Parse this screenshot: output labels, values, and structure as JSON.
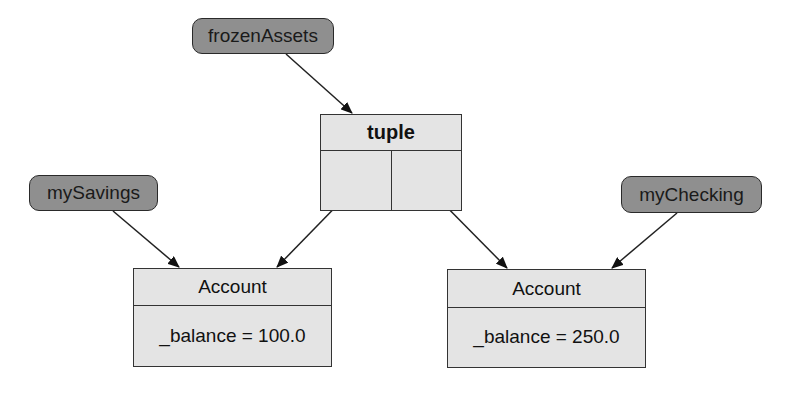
{
  "diagram": {
    "references": [
      {
        "id": "frozenAssets",
        "label": "frozenAssets"
      },
      {
        "id": "mySavings",
        "label": "mySavings"
      },
      {
        "id": "myChecking",
        "label": "myChecking"
      }
    ],
    "tuple": {
      "title": "tuple",
      "slots": 2
    },
    "accounts": [
      {
        "title": "Account",
        "field": "_balance = 100.0"
      },
      {
        "title": "Account",
        "field": "_balance = 250.0"
      }
    ],
    "edges": [
      {
        "from": "frozenAssets",
        "to": "tuple"
      },
      {
        "from": "tuple.slot0",
        "to": "accounts.0"
      },
      {
        "from": "tuple.slot1",
        "to": "accounts.1"
      },
      {
        "from": "mySavings",
        "to": "accounts.0"
      },
      {
        "from": "myChecking",
        "to": "accounts.1"
      }
    ],
    "colors": {
      "reference_fill": "#8f8f8f",
      "object_fill": "#e4e4e4",
      "stroke": "#333333"
    }
  }
}
